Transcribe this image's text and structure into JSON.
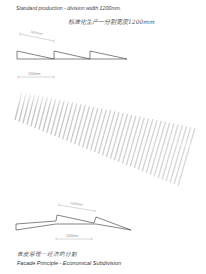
{
  "diagram": {
    "header": {
      "title_en": "Standard production - division width 1200mm.",
      "title_cn": "标准化生产一分割宽度1200mm"
    },
    "top_detail": {
      "dimension_slanted": "1200mm",
      "dimension_horizontal": "1200mm",
      "teeth_count": 3
    },
    "facade_stripes": {
      "stripe_count": 42,
      "stripe_color": "#b8b8b8"
    },
    "bottom_detail": {
      "dimension_upper": "1200mm",
      "dimension_lower": "1200mm"
    },
    "footer": {
      "caption_cn": "表皮原理一经济的分割",
      "caption_en": "Facade Principle  - Economical Subdivision"
    },
    "colors": {
      "line": "#333333",
      "dimension": "#999999",
      "background": "#ffffff"
    }
  }
}
